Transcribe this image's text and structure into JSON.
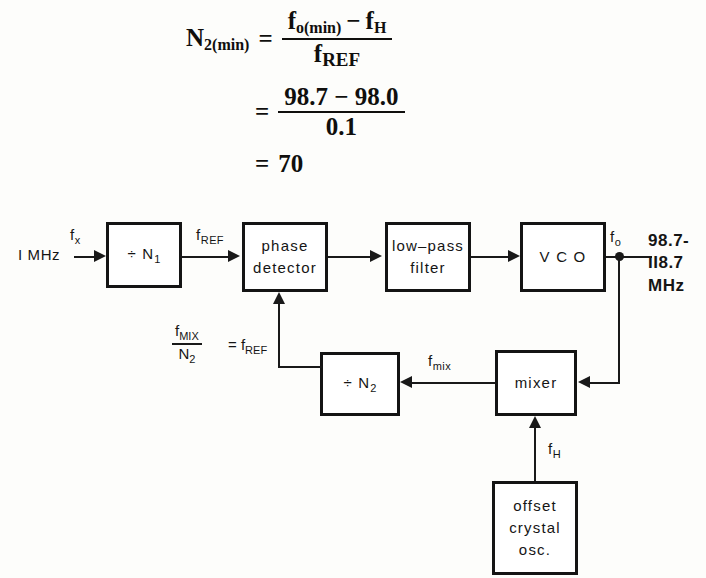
{
  "equation": {
    "lhs": "N",
    "lhs_sub": "2(min)",
    "equals": "=",
    "line1": {
      "numerator_first": "f",
      "numerator_first_sub": "o(min)",
      "minus": "−",
      "numerator_second": "f",
      "numerator_second_sub": "H",
      "denominator": "f",
      "denominator_sub": "REF"
    },
    "line2": {
      "numerator": "98.7 − 98.0",
      "denominator": "0.1"
    },
    "line3": {
      "result": "70"
    }
  },
  "diagram": {
    "blocks": [
      {
        "id": "divider-n1",
        "lines": [
          "÷ N"
        ],
        "sub": "1"
      },
      {
        "id": "phase-detector",
        "lines": [
          "phase",
          "detector"
        ]
      },
      {
        "id": "low-pass-filter",
        "lines": [
          "low–pass",
          "filter"
        ]
      },
      {
        "id": "vco",
        "lines": [
          "V C O"
        ]
      },
      {
        "id": "divider-n2",
        "lines": [
          "÷ N"
        ],
        "sub": "2"
      },
      {
        "id": "mixer",
        "lines": [
          "mixer"
        ]
      },
      {
        "id": "offset-crystal-osc",
        "lines": [
          "offset",
          "crystal",
          "osc."
        ]
      }
    ],
    "labels": {
      "input_source": "I MHz",
      "fx": "f",
      "fx_sub": "x",
      "fref": "f",
      "fref_sub": "REF",
      "fo": "f",
      "fo_sub": "o",
      "fmix": "f",
      "fmix_sub": "mix",
      "fh": "f",
      "fh_sub": "H",
      "feedback_num": "f",
      "feedback_num_sub": "MIX",
      "feedback_den": "N",
      "feedback_den_sub": "2",
      "feedback_equals": "=",
      "feedback_result": "f",
      "feedback_result_sub": "REF",
      "output_line1": "98.7-",
      "output_line2": "II8.7",
      "output_line3": "MHz"
    }
  },
  "colors": {
    "ink": "#151515",
    "page": "#fdfdfb"
  }
}
